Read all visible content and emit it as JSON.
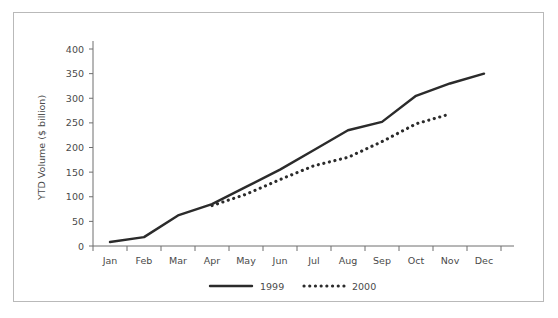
{
  "chart_data": {
    "type": "line",
    "title": "",
    "xlabel": "",
    "ylabel": "YTD Volume ($ billion)",
    "categories": [
      "Jan",
      "Feb",
      "Mar",
      "Apr",
      "May",
      "Jun",
      "Jul",
      "Aug",
      "Sep",
      "Oct",
      "Nov",
      "Dec"
    ],
    "ylim": [
      0,
      400
    ],
    "ytick_labels": [
      "0",
      "50",
      "100",
      "150",
      "200",
      "250",
      "300",
      "350",
      "400"
    ],
    "ytick_values": [
      0,
      50,
      100,
      150,
      200,
      250,
      300,
      350,
      400
    ],
    "grid": false,
    "legend_position": "bottom-center",
    "series": [
      {
        "name": "1999",
        "style": "solid",
        "color": "#2b2b2b",
        "values": [
          8,
          18,
          62,
          85,
          120,
          155,
          195,
          235,
          252,
          305,
          330,
          350
        ]
      },
      {
        "name": "2000",
        "style": "dotted",
        "color": "#2b2b2b",
        "values": [
          null,
          null,
          null,
          82,
          105,
          135,
          163,
          180,
          212,
          248,
          268,
          null
        ]
      }
    ]
  },
  "legend": {
    "items": [
      {
        "label": "1999",
        "style": "solid"
      },
      {
        "label": "2000",
        "style": "dotted"
      }
    ]
  }
}
